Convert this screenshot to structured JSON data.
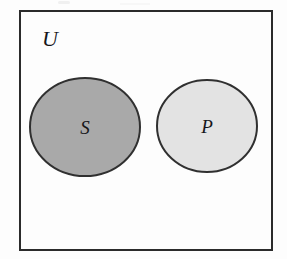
{
  "figure": {
    "type": "euler-diagram",
    "caption": "",
    "background_color": "#fdfdfd"
  },
  "universe": {
    "label": "U",
    "name": "universal-set",
    "border_color": "#2b2b2b",
    "fill_color": "#fdfdfd",
    "border_width": 2,
    "rect": {
      "x": 20,
      "y": 11,
      "width": 252,
      "height": 239
    },
    "label_position": {
      "x": 50,
      "y": 46
    }
  },
  "sets": [
    {
      "label": "S",
      "name": "set-s",
      "fill_color": "#a9a9a9",
      "border_color": "#303030",
      "border_width": 2,
      "ellipse": {
        "cx": 85,
        "cy": 127,
        "rx": 55,
        "ry": 49
      },
      "label_position": {
        "x": 85,
        "y": 134
      }
    },
    {
      "label": "P",
      "name": "set-p",
      "fill_color": "#e3e3e3",
      "border_color": "#303030",
      "border_width": 2,
      "ellipse": {
        "cx": 207,
        "cy": 126,
        "rx": 50,
        "ry": 46
      },
      "label_position": {
        "x": 207,
        "y": 133
      }
    }
  ],
  "relations": {
    "overlap": "none",
    "description": "S and P are disjoint sets drawn inside universal set U"
  }
}
